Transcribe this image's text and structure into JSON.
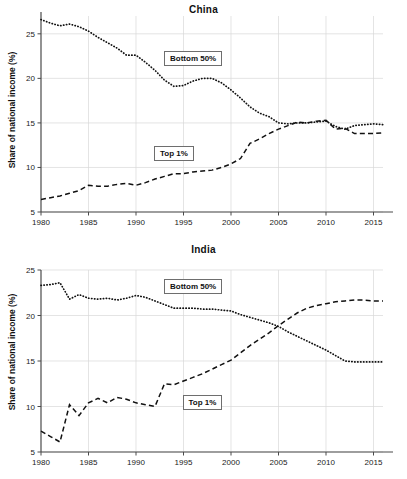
{
  "figure": {
    "background": "#ffffff",
    "line_color": "#111111",
    "grid_color": "#d8d8d8",
    "axis_color": "#4a4a4a"
  },
  "chart_data": [
    {
      "type": "line",
      "title": "China",
      "xlabel": "",
      "ylabel": "Share of national income (%)",
      "xlim": [
        1980,
        2016
      ],
      "ylim": [
        5,
        27
      ],
      "xticks": [
        1980,
        1985,
        1990,
        1995,
        2000,
        2005,
        2010,
        2015
      ],
      "yticks": [
        5,
        10,
        15,
        20,
        25
      ],
      "grid": true,
      "legend_position": "inline-annotations",
      "annotations": [
        {
          "text": "Bottom 50%",
          "x": 1996,
          "y": 22.2
        },
        {
          "text": "Top 1%",
          "x": 1994,
          "y": 11.6
        }
      ],
      "x": [
        1980,
        1981,
        1982,
        1983,
        1984,
        1985,
        1986,
        1987,
        1988,
        1989,
        1990,
        1991,
        1992,
        1993,
        1994,
        1995,
        1996,
        1997,
        1998,
        1999,
        2000,
        2001,
        2002,
        2003,
        2004,
        2005,
        2006,
        2007,
        2008,
        2009,
        2010,
        2011,
        2012,
        2013,
        2014,
        2015,
        2016
      ],
      "series": [
        {
          "name": "Bottom 50%",
          "style": "dotted",
          "values": [
            26.6,
            26.2,
            25.9,
            26.1,
            25.8,
            25.3,
            24.6,
            24.0,
            23.4,
            22.6,
            22.6,
            21.8,
            20.9,
            19.8,
            19.1,
            19.2,
            19.7,
            20.0,
            20.0,
            19.5,
            18.7,
            17.8,
            16.8,
            16.1,
            15.7,
            15.0,
            14.9,
            15.0,
            15.0,
            15.1,
            15.2,
            14.6,
            14.3,
            14.7,
            14.8,
            14.9,
            14.8
          ]
        },
        {
          "name": "Top 1%",
          "style": "dashed",
          "values": [
            6.4,
            6.6,
            6.8,
            7.1,
            7.4,
            8.0,
            7.9,
            7.9,
            8.1,
            8.2,
            8.0,
            8.3,
            8.7,
            9.0,
            9.3,
            9.3,
            9.5,
            9.6,
            9.7,
            10.0,
            10.4,
            11.0,
            12.7,
            13.2,
            13.8,
            14.3,
            14.7,
            15.1,
            15.0,
            15.2,
            15.3,
            14.3,
            14.4,
            13.8,
            13.8,
            13.8,
            13.9
          ]
        }
      ]
    },
    {
      "type": "line",
      "title": "India",
      "xlabel": "",
      "ylabel": "Share of national income (%)",
      "xlim": [
        1980,
        2016
      ],
      "ylim": [
        5,
        25
      ],
      "xticks": [
        1980,
        1985,
        1990,
        1995,
        2000,
        2005,
        2010,
        2015
      ],
      "yticks": [
        5,
        10,
        15,
        20,
        25
      ],
      "grid": true,
      "legend_position": "inline-annotations",
      "annotations": [
        {
          "text": "Bottom 50%",
          "x": 1996,
          "y": 23.2
        },
        {
          "text": "Top 1%",
          "x": 1997,
          "y": 10.4
        }
      ],
      "x": [
        1980,
        1981,
        1982,
        1983,
        1984,
        1985,
        1986,
        1987,
        1988,
        1989,
        1990,
        1991,
        1992,
        1993,
        1994,
        1995,
        1996,
        1997,
        1998,
        1999,
        2000,
        2001,
        2002,
        2003,
        2004,
        2005,
        2006,
        2007,
        2008,
        2009,
        2010,
        2011,
        2012,
        2013,
        2014,
        2015,
        2016
      ],
      "series": [
        {
          "name": "Bottom 50%",
          "style": "dotted",
          "values": [
            23.3,
            23.4,
            23.6,
            21.8,
            22.3,
            21.9,
            21.8,
            21.9,
            21.7,
            21.9,
            22.2,
            22.0,
            21.6,
            21.2,
            20.8,
            20.8,
            20.8,
            20.7,
            20.7,
            20.6,
            20.5,
            20.1,
            19.8,
            19.5,
            19.2,
            18.8,
            18.2,
            17.7,
            17.2,
            16.7,
            16.2,
            15.6,
            15.0,
            14.9,
            14.9,
            14.9,
            14.9
          ]
        },
        {
          "name": "Top 1%",
          "style": "dashed",
          "values": [
            7.3,
            6.7,
            6.1,
            10.2,
            9.0,
            10.4,
            10.9,
            10.4,
            11.0,
            10.8,
            10.4,
            10.2,
            10.0,
            12.5,
            12.4,
            12.8,
            13.2,
            13.6,
            14.1,
            14.6,
            15.1,
            15.9,
            16.7,
            17.4,
            18.1,
            18.9,
            19.6,
            20.3,
            20.8,
            21.1,
            21.3,
            21.5,
            21.6,
            21.7,
            21.7,
            21.6,
            21.6
          ]
        }
      ]
    }
  ]
}
